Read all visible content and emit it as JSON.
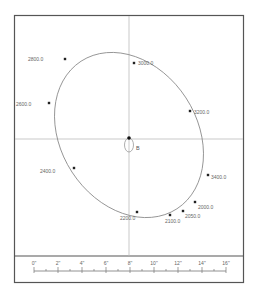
{
  "diagram": {
    "type": "orbit-plot",
    "center_label": "B",
    "points": [
      {
        "label": "2800.0",
        "x": 65,
        "y": 59,
        "lx": 28,
        "ly": 59,
        "anchor": "start"
      },
      {
        "label": "3000.0",
        "x": 134,
        "y": 63,
        "lx": 138,
        "ly": 63,
        "anchor": "start"
      },
      {
        "label": "2600.0",
        "x": 49,
        "y": 103,
        "lx": 16,
        "ly": 104,
        "anchor": "start"
      },
      {
        "label": "3200.0",
        "x": 190,
        "y": 111,
        "lx": 194,
        "ly": 112,
        "anchor": "start"
      },
      {
        "label": "2400.0",
        "x": 74,
        "y": 168,
        "lx": 40,
        "ly": 171,
        "anchor": "start"
      },
      {
        "label": "3400.0",
        "x": 208,
        "y": 175,
        "lx": 211,
        "ly": 177,
        "anchor": "start"
      },
      {
        "label": "2000.0",
        "x": 195,
        "y": 202,
        "lx": 198,
        "ly": 207,
        "anchor": "start"
      },
      {
        "label": "2050.0",
        "x": 183,
        "y": 211,
        "lx": 185,
        "ly": 216,
        "anchor": "start"
      },
      {
        "label": "2100.0",
        "x": 170,
        "y": 215,
        "lx": 165,
        "ly": 221,
        "anchor": "start"
      },
      {
        "label": "2200.0",
        "x": 137,
        "y": 212,
        "lx": 120,
        "ly": 218,
        "anchor": "start"
      }
    ]
  },
  "ruler": {
    "labels": [
      "0\"",
      "2\"",
      "4\"",
      "6\"",
      "8\"",
      "10\"",
      "12\"",
      "14\"",
      "16\""
    ]
  }
}
